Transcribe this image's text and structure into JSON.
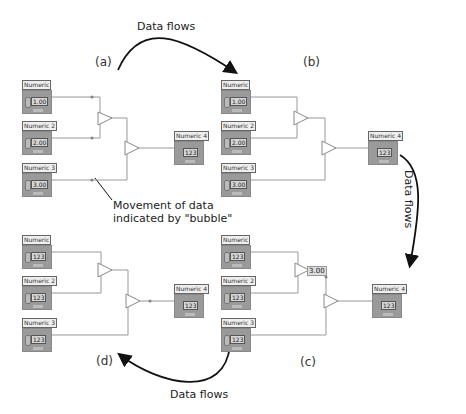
{
  "figure": {
    "annotations": {
      "top_flow": "Data flows",
      "right_flow": "Data flows",
      "bottom_flow": "Data flows",
      "bubble_note_line1": "Movement of data",
      "bubble_note_line2": "indicated by \"bubble\""
    },
    "panels": [
      {
        "id": "a",
        "label": "(a)",
        "inputs": [
          {
            "name": "Numeric",
            "value": "1.00"
          },
          {
            "name": "Numeric 2",
            "value": "2.00"
          },
          {
            "name": "Numeric 3",
            "value": "3.00"
          }
        ],
        "output": {
          "name": "Numeric 4",
          "value": "123"
        },
        "add_op_value": ""
      },
      {
        "id": "b",
        "label": "(b)",
        "inputs": [
          {
            "name": "Numeric",
            "value": "1.00"
          },
          {
            "name": "Numeric 2",
            "value": "2.00"
          },
          {
            "name": "Numeric 3",
            "value": "3.00"
          }
        ],
        "output": {
          "name": "Numeric 4",
          "value": "123"
        },
        "add_op_value": ""
      },
      {
        "id": "c",
        "label": "(c)",
        "inputs": [
          {
            "name": "Numeric",
            "value": "123"
          },
          {
            "name": "Numeric 2",
            "value": "123"
          },
          {
            "name": "Numeric 3",
            "value": "123"
          }
        ],
        "output": {
          "name": "Numeric 4",
          "value": "123"
        },
        "add_op_value": "3.00"
      },
      {
        "id": "d",
        "label": "(d)",
        "inputs": [
          {
            "name": "Numeric",
            "value": "123"
          },
          {
            "name": "Numeric 2",
            "value": "123"
          },
          {
            "name": "Numeric 3",
            "value": "123"
          }
        ],
        "output": {
          "name": "Numeric 4",
          "value": "123"
        },
        "add_op_value": ""
      }
    ]
  }
}
